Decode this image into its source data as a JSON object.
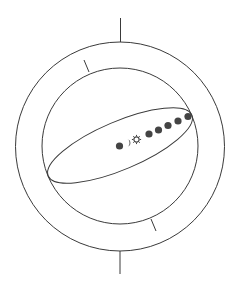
{
  "diagram": {
    "type": "geocentric-cosmos",
    "colors": {
      "line": "#3a3a3a",
      "body_fill": "#444444",
      "background": "#ffffff"
    },
    "outer_sphere": {
      "cx": 120,
      "cy": 146.5,
      "r": 104.5
    },
    "inner_sphere": {
      "cx": 120,
      "cy": 146,
      "r": 78
    },
    "axis_top": {
      "x1": 120.5,
      "y1": 18,
      "x2": 120.5,
      "y2": 42
    },
    "axis_bottom": {
      "x1": 120,
      "y1": 251,
      "x2": 120,
      "y2": 274
    },
    "tick_top": {
      "x1": 84,
      "y1": 60,
      "x2": 89,
      "y2": 72
    },
    "tick_bottom": {
      "x1": 151,
      "y1": 219,
      "x2": 156,
      "y2": 231
    },
    "ecliptic": {
      "cx": 120,
      "cy": 145.5,
      "rx": 78,
      "ry": 24,
      "rotation": -23
    },
    "bodies": [
      {
        "name": "earth",
        "kind": "filled",
        "x": 119.5,
        "y": 146,
        "r": 3.6
      },
      {
        "name": "moon",
        "kind": "crescent",
        "x": 128,
        "y": 143,
        "r": 3.4
      },
      {
        "name": "sun",
        "kind": "sun",
        "x": 136.5,
        "y": 139.5,
        "r": 2.6
      },
      {
        "name": "planet-1",
        "kind": "filled",
        "x": 149,
        "y": 134,
        "r": 3.6
      },
      {
        "name": "planet-2",
        "kind": "filled",
        "x": 158.5,
        "y": 130,
        "r": 3.6
      },
      {
        "name": "planet-3",
        "kind": "filled",
        "x": 168,
        "y": 125.5,
        "r": 3.6
      },
      {
        "name": "planet-4",
        "kind": "filled",
        "x": 178,
        "y": 121,
        "r": 3.6
      },
      {
        "name": "planet-5",
        "kind": "filled",
        "x": 188,
        "y": 116.5,
        "r": 3.6
      }
    ]
  }
}
